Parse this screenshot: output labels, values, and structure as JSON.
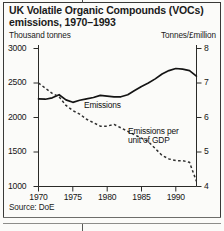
{
  "title": "UK Volatile Organic Compounds (VOCs) emissions, 1970–1993",
  "axis_units": {
    "left": "Thousand tonnes",
    "right": "Tonnes/£million"
  },
  "source": "Source: DoE",
  "labels": {
    "emissions": "Emissions",
    "gdp_line1": "Emissions per",
    "gdp_line2": "unit of GDP"
  },
  "ticks": {
    "left": [
      "3000",
      "2500",
      "2000",
      "1500",
      "1000"
    ],
    "right": [
      "8",
      "7",
      "6",
      "5",
      "4"
    ],
    "x": [
      "1970",
      "1975",
      "1980",
      "1985",
      "1990"
    ]
  },
  "colors": {
    "ink": "#1a1a1a",
    "line": "#141414",
    "background": "#fbfbf9"
  },
  "chart_data": {
    "type": "line",
    "title": "UK Volatile Organic Compounds (VOCs) emissions, 1970–1993",
    "xlabel": "",
    "ylabel": "Thousand tonnes",
    "y2label": "Tonnes/£million",
    "xlim": [
      1970,
      1993
    ],
    "ylim": [
      1000,
      3000
    ],
    "y2lim": [
      4,
      8
    ],
    "grid": false,
    "legend": "inline-annotations",
    "x": [
      1970,
      1971,
      1972,
      1973,
      1974,
      1975,
      1976,
      1977,
      1978,
      1979,
      1980,
      1981,
      1982,
      1983,
      1984,
      1985,
      1986,
      1987,
      1988,
      1989,
      1990,
      1991,
      1992,
      1993
    ],
    "series": [
      {
        "name": "Emissions",
        "axis": "left",
        "style": "solid",
        "units": "Thousand tonnes",
        "values": [
          2270,
          2265,
          2285,
          2330,
          2255,
          2220,
          2250,
          2270,
          2290,
          2320,
          2310,
          2300,
          2300,
          2330,
          2390,
          2450,
          2500,
          2560,
          2630,
          2680,
          2710,
          2700,
          2680,
          2600
        ]
      },
      {
        "name": "Emissions per unit of GDP",
        "axis": "right",
        "style": "dashed",
        "units": "Tonnes/£million",
        "values": [
          7.0,
          6.85,
          6.7,
          6.6,
          6.35,
          6.2,
          6.1,
          5.95,
          5.85,
          5.75,
          5.75,
          5.8,
          5.7,
          5.6,
          5.5,
          5.4,
          5.3,
          5.1,
          4.9,
          4.8,
          4.75,
          4.75,
          4.7,
          4.15
        ]
      }
    ]
  }
}
